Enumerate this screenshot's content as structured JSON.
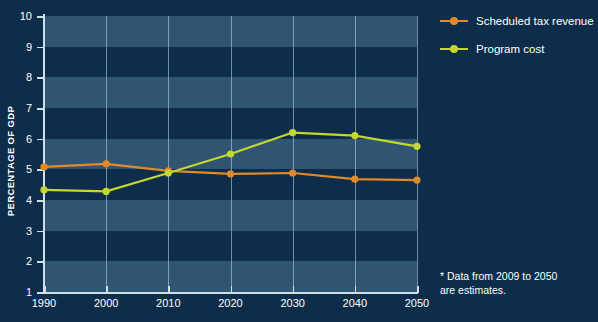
{
  "chart_data": {
    "type": "line",
    "title": "",
    "xlabel": "",
    "ylabel": "PERCENTAGE OF GDP",
    "categories": [
      1990,
      2000,
      2010,
      2020,
      2030,
      2040,
      2050
    ],
    "x_tick_labels": [
      "1990",
      "2000",
      "2010",
      "2020",
      "2030",
      "2040",
      "2050"
    ],
    "y_tick_labels": [
      "10",
      "9",
      "8",
      "7",
      "6",
      "5",
      "4",
      "3",
      "2",
      "1"
    ],
    "ylim": [
      1,
      10
    ],
    "xlim": [
      1990,
      2050
    ],
    "grid": "vertical-gridlines-and-horizontal-bands",
    "legend_position": "top-right",
    "series": [
      {
        "name": "Scheduled tax revenue",
        "color": "#e08a28",
        "values": [
          5.08,
          5.18,
          4.95,
          4.85,
          4.88,
          4.68,
          4.65
        ]
      },
      {
        "name": "Program cost",
        "color": "#c3d72e",
        "values": [
          4.33,
          4.28,
          4.88,
          5.5,
          6.2,
          6.1,
          5.75
        ]
      }
    ],
    "annotations": [
      "* Data from 2009 to 2050 are estimates."
    ]
  },
  "legend": {
    "items": [
      {
        "label": "Scheduled tax revenue",
        "color": "#e08a28"
      },
      {
        "label": "Program cost",
        "color": "#c3d72e"
      }
    ]
  },
  "footnote": {
    "line1": "* Data from 2009 to 2050",
    "line2": "are estimates."
  },
  "colors": {
    "background": "#0d2d4a",
    "band": "#476e8d",
    "axis": "#cfe0ea",
    "gridline": "#c6dceb",
    "text": "#ffffff",
    "series_tax_revenue": "#e08a28",
    "series_program_cost": "#c3d72e"
  }
}
